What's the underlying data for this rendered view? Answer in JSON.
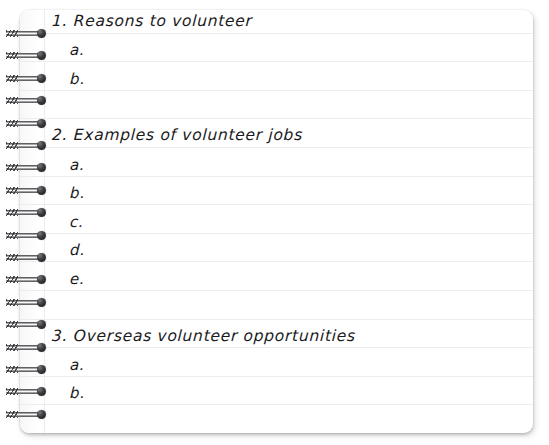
{
  "document": {
    "kind": "spiral-notebook-page",
    "title": "Volunteer notes outline"
  },
  "appearance": {
    "background_color": "#ffffff",
    "paper_color": "#ffffff",
    "rule_line_color": "#eceded",
    "margin_line_color": "#ededee",
    "ink_color": "#1a1a1c",
    "ring_color": "#18181b",
    "ring_count": 18
  },
  "outline": {
    "items": [
      {
        "number": "1.",
        "heading": "1. Reasons to volunteer",
        "subitems": [
          "a.",
          "b."
        ]
      },
      {
        "number": "2.",
        "heading": "2. Examples of volunteer jobs",
        "subitems": [
          "a.",
          "b.",
          "c.",
          "d.",
          "e."
        ]
      },
      {
        "number": "3.",
        "heading": "3. Overseas volunteer opportunities",
        "subitems": [
          "a.",
          "b."
        ]
      }
    ]
  },
  "lines": [
    {
      "slot": 0,
      "text": "1. Reasons to volunteer",
      "style": "heading"
    },
    {
      "slot": 1,
      "text": "a.",
      "style": "sub"
    },
    {
      "slot": 2,
      "text": "b.",
      "style": "sub"
    },
    {
      "slot": 3,
      "text": "",
      "style": "blank"
    },
    {
      "slot": 4,
      "text": "2. Examples of volunteer jobs",
      "style": "heading"
    },
    {
      "slot": 5,
      "text": "a.",
      "style": "sub"
    },
    {
      "slot": 6,
      "text": "b.",
      "style": "sub"
    },
    {
      "slot": 7,
      "text": "c.",
      "style": "sub"
    },
    {
      "slot": 8,
      "text": "d.",
      "style": "sub"
    },
    {
      "slot": 9,
      "text": "e.",
      "style": "sub"
    },
    {
      "slot": 10,
      "text": "",
      "style": "blank"
    },
    {
      "slot": 11,
      "text": "3. Overseas volunteer opportunities",
      "style": "heading"
    },
    {
      "slot": 12,
      "text": "a.",
      "style": "sub"
    },
    {
      "slot": 13,
      "text": "b.",
      "style": "sub"
    },
    {
      "slot": 14,
      "text": "",
      "style": "blank"
    }
  ]
}
